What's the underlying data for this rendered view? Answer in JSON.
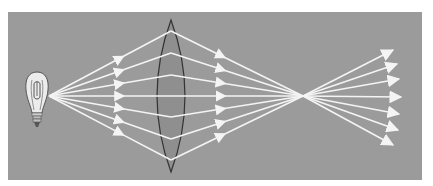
{
  "diagram": {
    "colors": {
      "page_background": "#ffffff",
      "panel_background": "#9b9b9b",
      "lens_fill": "#8f8f8f",
      "lens_outline": "#333333",
      "ray_color": "#f4f4f4",
      "bulb_glass": "#e8e8e8",
      "bulb_outline": "#555555"
    },
    "panel": {
      "x": 8,
      "y": 12,
      "width": 414,
      "height": 168
    },
    "source": {
      "label": "light-bulb",
      "emit_x": 49,
      "emit_y": 96
    },
    "lens": {
      "type": "biconvex",
      "center_x": 171,
      "top_y": 20,
      "bottom_y": 172,
      "half_width": 14
    },
    "focal_point": {
      "x": 303,
      "y": 96
    },
    "rays": [
      {
        "lens_y": 31,
        "end_x": 393,
        "end_y": 50
      },
      {
        "lens_y": 53,
        "end_x": 397,
        "end_y": 64
      },
      {
        "lens_y": 75,
        "end_x": 399,
        "end_y": 79
      },
      {
        "lens_y": 96,
        "end_x": 401,
        "end_y": 97
      },
      {
        "lens_y": 117,
        "end_x": 399,
        "end_y": 114
      },
      {
        "lens_y": 139,
        "end_x": 398,
        "end_y": 130
      },
      {
        "lens_y": 160,
        "end_x": 393,
        "end_y": 145
      }
    ]
  }
}
